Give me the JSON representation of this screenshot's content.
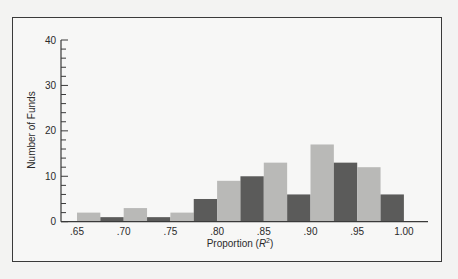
{
  "chart_data": {
    "type": "bar",
    "title": "",
    "xlabel": "Proportion (R²)",
    "ylabel": "Number of Funds",
    "ylim": [
      0,
      40
    ],
    "yticks": [
      0,
      10,
      20,
      30,
      40
    ],
    "y_minor_tick_step": 2,
    "xticks": [
      ".65",
      ".70",
      ".75",
      ".80",
      ".85",
      ".90",
      ".95",
      "1.00"
    ],
    "grid": false,
    "legend": null,
    "bin_width": 0.025,
    "categories": [
      ".650",
      ".675",
      ".700",
      ".725",
      ".750",
      ".775",
      ".800",
      ".825",
      ".850",
      ".875",
      ".900",
      ".925",
      ".950",
      ".975"
    ],
    "values": [
      2,
      1,
      3,
      1,
      2,
      5,
      9,
      10,
      13,
      6,
      17,
      13,
      12,
      6
    ],
    "bar_shades": [
      "light",
      "dark",
      "light",
      "dark",
      "light",
      "dark",
      "light",
      "dark",
      "light",
      "dark",
      "light",
      "dark",
      "light",
      "dark"
    ],
    "colors": {
      "light": "#b9b9b7",
      "dark": "#5b5b5a"
    }
  }
}
